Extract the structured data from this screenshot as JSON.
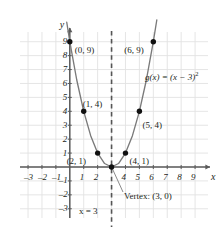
{
  "chart_data": {
    "type": "line",
    "title": "",
    "subtitle": "",
    "xlabel": "x",
    "ylabel": "y",
    "xlim": [
      -3.6,
      10.0
    ],
    "ylim": [
      -3.7,
      9.9
    ],
    "grid": true,
    "legend": "none",
    "function_label": "g(x) = (x − 3)",
    "function_exponent": "2",
    "function_expression": "g(x) = (x - 3)^2",
    "curve": {
      "name": "g(x) = (x - 3)^2",
      "color": "#7a7a7a",
      "x": [
        -0.22,
        0.0,
        0.5,
        1.0,
        1.5,
        2.0,
        2.5,
        3.0,
        3.5,
        4.0,
        4.5,
        5.0,
        5.5,
        6.0,
        6.25
      ],
      "y": [
        10.4,
        9.0,
        6.25,
        4.0,
        2.25,
        1.0,
        0.25,
        0.0,
        0.25,
        1.0,
        2.25,
        4.0,
        6.25,
        9.0,
        10.56
      ]
    },
    "points": [
      {
        "x": 0,
        "y": 9,
        "label": "(0, 9)",
        "label_dx": 5,
        "label_dy": 4
      },
      {
        "x": 1,
        "y": 4,
        "label": "(1, 4)",
        "label_dx": -1,
        "label_dy": -11
      },
      {
        "x": 2,
        "y": 1,
        "label": "(2, 1)",
        "label_dx": -31,
        "label_dy": 4
      },
      {
        "x": 3,
        "y": 0,
        "label": "",
        "label_dx": 0,
        "label_dy": 0
      },
      {
        "x": 4,
        "y": 1,
        "label": "(4, 1)",
        "label_dx": 4,
        "label_dy": 4
      },
      {
        "x": 5,
        "y": 4,
        "label": "(5, 4)",
        "label_dx": 3,
        "label_dy": 10
      },
      {
        "x": 6,
        "y": 9,
        "label": "(6, 9)",
        "label_dx": -29,
        "label_dy": 4
      }
    ],
    "vertex": {
      "x": 3,
      "y": 0,
      "label": "Vertex: (3, 0)"
    },
    "axis_of_symmetry": {
      "x": 3,
      "label": "x = 3",
      "style": "dashed"
    },
    "xticks": [
      -3,
      -2,
      -1,
      1,
      2,
      4,
      5,
      6,
      7,
      8,
      9
    ],
    "xtick_labels": [
      "–3",
      "–2",
      "–1",
      "1",
      "2",
      "4",
      "5",
      "6",
      "7",
      "8",
      "9"
    ],
    "yticks": [
      -3,
      -2,
      -1,
      1,
      2,
      3,
      4,
      5,
      6,
      7,
      8,
      9
    ],
    "ytick_labels": [
      "–3",
      "–2",
      "–1",
      "1",
      "2",
      "3",
      "4",
      "5",
      "6",
      "7",
      "8",
      "9"
    ],
    "colors": {
      "grid": "#e2e2e2",
      "axis": "#5a5a5a",
      "curve": "#7a7a7a",
      "point": "#111111",
      "text": "#231f20",
      "dashed": "#555555"
    }
  }
}
